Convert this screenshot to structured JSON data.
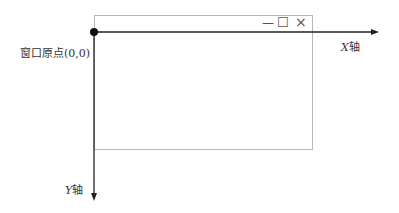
{
  "diagram": {
    "origin_label": "窗口原点(0,0)",
    "x_axis_label_var": "X",
    "x_axis_label_suffix": "轴",
    "y_axis_label_var": "Y",
    "y_axis_label_suffix": "轴",
    "window_controls": {
      "minimize": "—",
      "maximize": "☐",
      "close": "×"
    },
    "colors": {
      "axis": "#222222",
      "window_border": "#b8b8b8"
    }
  }
}
